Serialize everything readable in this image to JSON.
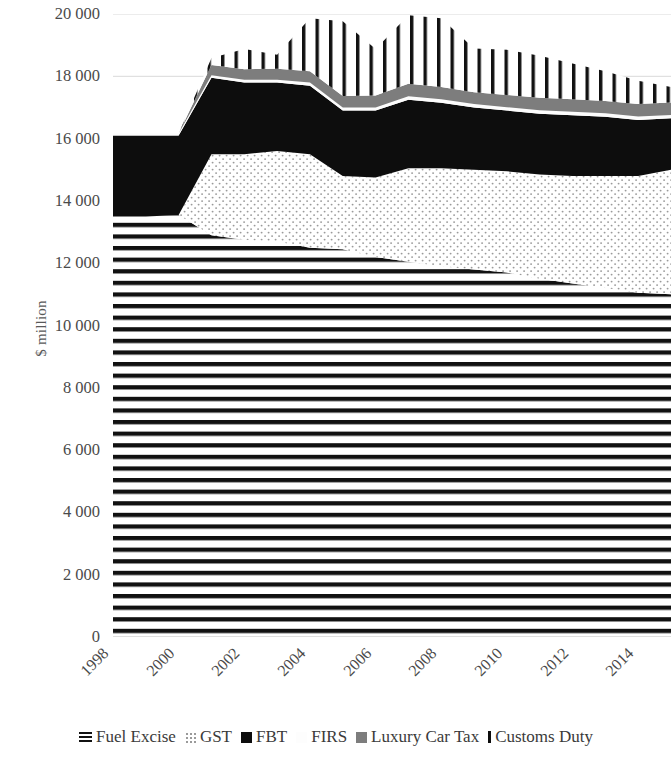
{
  "chart_data": {
    "type": "area",
    "title": "",
    "subtitle": "",
    "xlabel": "",
    "ylabel": "$ million",
    "stacked": true,
    "grid": true,
    "legend_position": "bottom",
    "xlim": [
      1998,
      2015
    ],
    "ylim": [
      0,
      20000
    ],
    "ytick_labels": [
      "20 000",
      "18 000",
      "16 000",
      "14 000",
      "12 000",
      "10 000",
      "8 000",
      "6 000",
      "4 000",
      "2 000",
      "0"
    ],
    "ytick_values": [
      20000,
      18000,
      16000,
      14000,
      12000,
      10000,
      8000,
      6000,
      4000,
      2000,
      0
    ],
    "xtick_labels": [
      "1998",
      "2000",
      "2002",
      "2004",
      "2006",
      "2008",
      "2010",
      "2012",
      "2014"
    ],
    "xtick_values": [
      1998,
      2000,
      2002,
      2004,
      2006,
      2008,
      2010,
      2012,
      2014
    ],
    "x": [
      1998,
      1999,
      2000,
      2001,
      2002,
      2003,
      2004,
      2005,
      2006,
      2007,
      2008,
      2009,
      2010,
      2011,
      2012,
      2013,
      2014,
      2015
    ],
    "categories": [
      1998,
      1999,
      2000,
      2001,
      2002,
      2003,
      2004,
      2005,
      2006,
      2007,
      2008,
      2009,
      2010,
      2011,
      2012,
      2013,
      2014,
      2015
    ],
    "series": [
      {
        "name": "Fuel Excise",
        "fill": "horizontal-lines",
        "color": "#111111",
        "values": [
          13500,
          13500,
          13550,
          12900,
          12750,
          12700,
          12500,
          12450,
          12200,
          12050,
          11900,
          11800,
          11700,
          11500,
          11350,
          11200,
          11050,
          11000
        ]
      },
      {
        "name": "GST",
        "fill": "light-dots",
        "color": "#e8e8e8",
        "values": [
          0,
          0,
          0,
          2600,
          2750,
          2900,
          3000,
          2350,
          2550,
          3000,
          3150,
          3200,
          3250,
          3350,
          3450,
          3600,
          3750,
          4000
        ]
      },
      {
        "name": "FBT",
        "fill": "solid-black",
        "color": "#0d0d0d",
        "values": [
          2600,
          2600,
          2550,
          2450,
          2300,
          2200,
          2200,
          2100,
          2150,
          2200,
          2100,
          2000,
          1950,
          1950,
          1950,
          1900,
          1800,
          1650
        ]
      },
      {
        "name": "FIRS",
        "fill": "white",
        "color": "#fbfbfb",
        "values": [
          60,
          60,
          60,
          80,
          90,
          90,
          100,
          100,
          100,
          110,
          110,
          110,
          110,
          110,
          110,
          110,
          110,
          110
        ]
      },
      {
        "name": "Luxury Car Tax",
        "fill": "solid-gray",
        "color": "#7d7d7d",
        "values": [
          0,
          0,
          0,
          330,
          340,
          350,
          360,
          370,
          380,
          400,
          400,
          380,
          390,
          400,
          400,
          400,
          400,
          400
        ]
      },
      {
        "name": "Customs Duty",
        "fill": "vertical-lines",
        "color": "#111111",
        "values": [
          0,
          0,
          0,
          230,
          650,
          450,
          1700,
          2400,
          1500,
          2200,
          2200,
          1400,
          1450,
          1350,
          1150,
          950,
          750,
          500
        ]
      }
    ],
    "totals": [
      16160,
      16160,
      16160,
      18590,
      18880,
      18690,
      19860,
      19770,
      18880,
      19960,
      19860,
      18890,
      18850,
      18660,
      18410,
      18160,
      17860,
      17660
    ]
  },
  "legend": {
    "items": [
      {
        "label": "Fuel Excise",
        "swatch": "horizontal-lines-swatch"
      },
      {
        "label": "GST",
        "swatch": "light-dots-swatch"
      },
      {
        "label": "FBT",
        "swatch": "solid-black-swatch"
      },
      {
        "label": "FIRS",
        "swatch": "white-swatch"
      },
      {
        "label": "Luxury Car Tax",
        "swatch": "solid-gray-swatch"
      },
      {
        "label": "Customs Duty",
        "swatch": "vertical-lines-swatch"
      }
    ]
  },
  "colors": {
    "axis_text": "#4a4a4a",
    "gridline": "#d9d9d9",
    "black": "#0d0d0d",
    "gray": "#7d7d7d",
    "white": "#ffffff"
  }
}
